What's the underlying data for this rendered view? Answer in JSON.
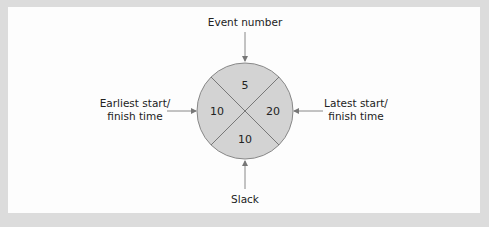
{
  "diagram": {
    "labels": {
      "top": "Event number",
      "left_line1": "Earliest start/",
      "left_line2": "finish time",
      "right_line1": "Latest start/",
      "right_line2": "finish time",
      "bottom": "Slack"
    },
    "node": {
      "event_number": "5",
      "earliest_time": "10",
      "latest_time": "20",
      "slack": "10"
    },
    "colors": {
      "frame": "#dcdcdc",
      "background": "#fdfdfd",
      "node_fill": "#d3d3d3",
      "stroke": "#777777"
    }
  }
}
